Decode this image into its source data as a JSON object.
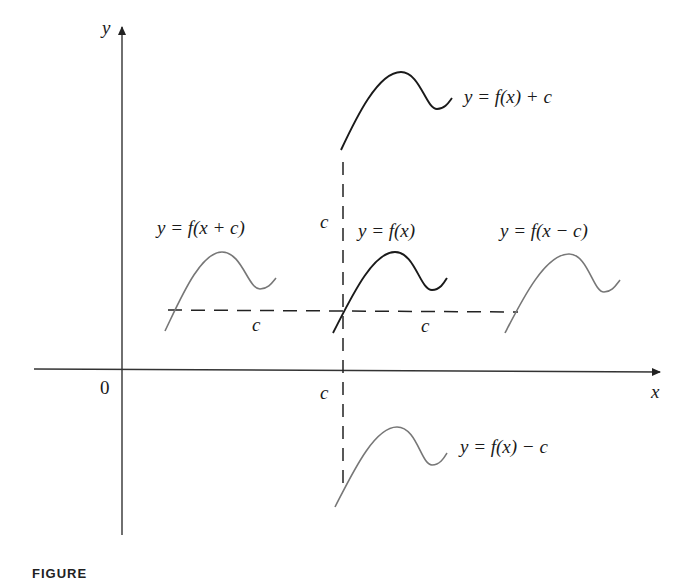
{
  "figure": {
    "axes": {
      "x_label": "x",
      "y_label": "y",
      "origin_label": "0",
      "c_tick_label": "c"
    },
    "curves": [
      {
        "id": "f",
        "label": "y = f(x)",
        "color": "#1a1a1a"
      },
      {
        "id": "f_plus_c",
        "label": "y = f(x) + c",
        "color": "#1a1a1a"
      },
      {
        "id": "f_minus_c",
        "label": "y = f(x) − c",
        "color": "#777777"
      },
      {
        "id": "f_x_plus_c",
        "label": "y = f(x + c)",
        "color": "#777777"
      },
      {
        "id": "f_x_minus_c",
        "label": "y = f(x − c)",
        "color": "#777777"
      }
    ],
    "shift_labels": {
      "vertical": "c",
      "horizontal_left": "c",
      "horizontal_right": "c"
    },
    "caption": "FIGURE"
  }
}
